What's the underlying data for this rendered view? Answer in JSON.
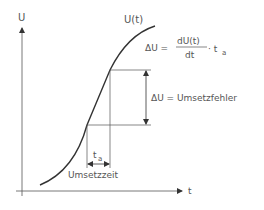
{
  "axes": {
    "y_label": "U",
    "x_label": "t"
  },
  "curve_label": "U(t)",
  "formula": {
    "lhs": "ΔU =",
    "numerator": "dU(t)",
    "denominator": "dt",
    "rhs": "· t",
    "rhs_sub": "a"
  },
  "delta_label": "ΔU = Umsetzfehler",
  "time_label": {
    "main": "t",
    "sub": "a"
  },
  "time_caption": "Umsetzzeit",
  "colors": {
    "line": "#333333",
    "text": "#555555"
  }
}
